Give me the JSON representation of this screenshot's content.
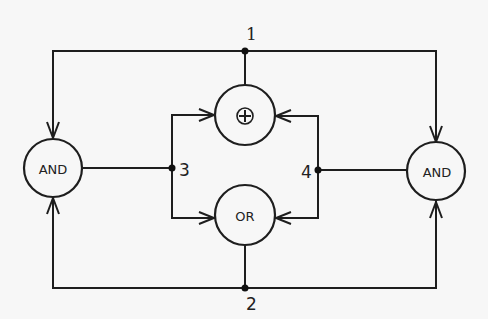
{
  "diagram": {
    "type": "logic-gate-network",
    "gates": [
      {
        "id": "and-left",
        "label": "AND"
      },
      {
        "id": "xor-top",
        "label": "⊕",
        "symbol": "circled-plus"
      },
      {
        "id": "or-bottom",
        "label": "OR"
      },
      {
        "id": "and-right",
        "label": "AND"
      }
    ],
    "nodes": [
      {
        "id": "n1",
        "label": "1"
      },
      {
        "id": "n2",
        "label": "2"
      },
      {
        "id": "n3",
        "label": "3"
      },
      {
        "id": "n4",
        "label": "4"
      }
    ],
    "connections": [
      {
        "from": "n1",
        "to": "and-left"
      },
      {
        "from": "n1",
        "to": "and-right"
      },
      {
        "from": "xor-top",
        "to": "n1"
      },
      {
        "from": "n2",
        "to": "and-left"
      },
      {
        "from": "n2",
        "to": "and-right"
      },
      {
        "from": "or-bottom",
        "to": "n2"
      },
      {
        "from": "and-left",
        "to": "n3"
      },
      {
        "from": "n3",
        "to": "xor-top"
      },
      {
        "from": "n3",
        "to": "or-bottom"
      },
      {
        "from": "and-right",
        "to": "n4"
      },
      {
        "from": "n4",
        "to": "xor-top"
      },
      {
        "from": "n4",
        "to": "or-bottom"
      }
    ],
    "colors": {
      "line": "#1e1e1e",
      "background": "#f7f7f7"
    }
  }
}
